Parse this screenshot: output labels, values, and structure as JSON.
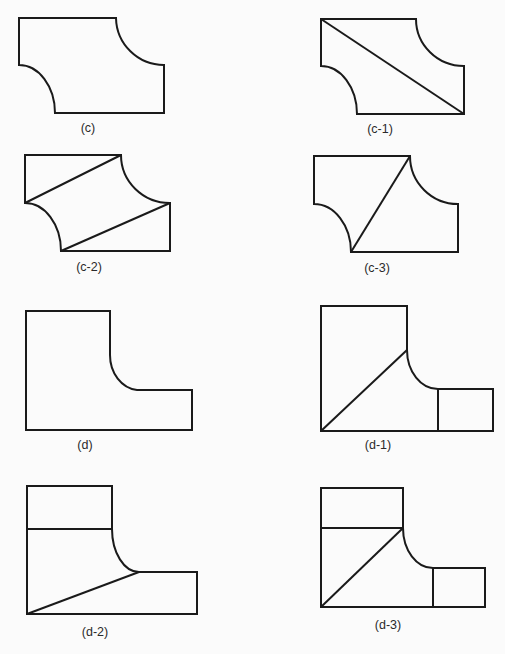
{
  "figures": [
    {
      "id": "c",
      "label": "(c)",
      "label_pos": [
        88,
        121
      ]
    },
    {
      "id": "c-1",
      "label": "(c-1)",
      "label_pos": [
        380,
        122
      ]
    },
    {
      "id": "c-2",
      "label": "(c-2)",
      "label_pos": [
        89,
        260
      ]
    },
    {
      "id": "c-3",
      "label": "(c-3)",
      "label_pos": [
        377,
        261
      ]
    },
    {
      "id": "d",
      "label": "(d)",
      "label_pos": [
        85,
        438
      ]
    },
    {
      "id": "d-1",
      "label": "(d-1)",
      "label_pos": [
        378,
        438
      ]
    },
    {
      "id": "d-2",
      "label": "(d-2)",
      "label_pos": [
        95,
        625
      ]
    },
    {
      "id": "d-3",
      "label": "(d-3)",
      "label_pos": [
        388,
        618
      ]
    }
  ],
  "colors": {
    "stroke": "#1a1a1a",
    "background": "#fbfbfb",
    "label": "#2a2a2a"
  }
}
